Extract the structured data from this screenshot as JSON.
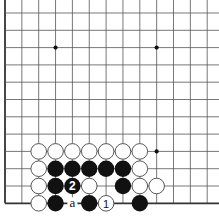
{
  "diagram": {
    "type": "go-board-problem",
    "board_fragment": {
      "columns_visible": 13,
      "rows_visible": 12,
      "left_edge": true,
      "bottom_edge": true,
      "origin_px": [
        5,
        13
      ],
      "spacing_px": [
        16.85,
        17.3
      ]
    },
    "colors": {
      "line": "#555555",
      "edge": "#333333",
      "black_stone": "#111111",
      "white_stone": "#ffffff",
      "white_stroke": "#444444"
    },
    "star_points": [
      [
        3,
        2
      ],
      [
        9,
        2
      ],
      [
        9,
        8
      ]
    ],
    "stones": [
      {
        "col": 2,
        "row": 8,
        "color": "white"
      },
      {
        "col": 3,
        "row": 8,
        "color": "white"
      },
      {
        "col": 4,
        "row": 8,
        "color": "white"
      },
      {
        "col": 5,
        "row": 8,
        "color": "white"
      },
      {
        "col": 6,
        "row": 8,
        "color": "white"
      },
      {
        "col": 7,
        "row": 8,
        "color": "white"
      },
      {
        "col": 8,
        "row": 8,
        "color": "white"
      },
      {
        "col": 2,
        "row": 9,
        "color": "white"
      },
      {
        "col": 3,
        "row": 9,
        "color": "black"
      },
      {
        "col": 4,
        "row": 9,
        "color": "black"
      },
      {
        "col": 5,
        "row": 9,
        "color": "black"
      },
      {
        "col": 6,
        "row": 9,
        "color": "black"
      },
      {
        "col": 7,
        "row": 9,
        "color": "black"
      },
      {
        "col": 8,
        "row": 9,
        "color": "white"
      },
      {
        "col": 2,
        "row": 10,
        "color": "white"
      },
      {
        "col": 3,
        "row": 10,
        "color": "black"
      },
      {
        "col": 4,
        "row": 10,
        "color": "black",
        "label": "2"
      },
      {
        "col": 5,
        "row": 10,
        "color": "white"
      },
      {
        "col": 7,
        "row": 10,
        "color": "black"
      },
      {
        "col": 8,
        "row": 10,
        "color": "white"
      },
      {
        "col": 9,
        "row": 10,
        "color": "white"
      },
      {
        "col": 2,
        "row": 11,
        "color": "white"
      },
      {
        "col": 3,
        "row": 11,
        "color": "black"
      },
      {
        "col": 5,
        "row": 11,
        "color": "black"
      },
      {
        "col": 6,
        "row": 11,
        "color": "white",
        "label": "1"
      },
      {
        "col": 8,
        "row": 11,
        "color": "black"
      }
    ],
    "point_labels": [
      {
        "col": 4,
        "row": 11,
        "text": "a"
      }
    ]
  }
}
